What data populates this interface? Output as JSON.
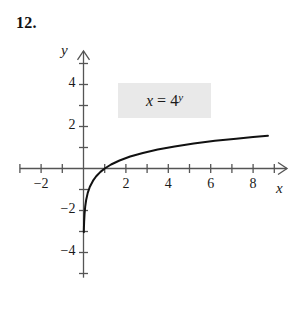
{
  "problem": {
    "number": "12."
  },
  "equation": {
    "variable": "x",
    "equals": "=",
    "base": "4",
    "exponent": "y",
    "full_text": "x = 4^y",
    "box_color": "#e9e9e9"
  },
  "axes": {
    "x_name": "x",
    "y_name": "y",
    "line_color": "#555555",
    "x_tick_labels": [
      {
        "value": -2,
        "text": "−2"
      },
      {
        "value": 2,
        "text": "2"
      },
      {
        "value": 4,
        "text": "4"
      },
      {
        "value": 6,
        "text": "6"
      },
      {
        "value": 8,
        "text": "8"
      }
    ],
    "y_tick_labels": [
      {
        "value": 4,
        "text": "4"
      },
      {
        "value": 2,
        "text": "2"
      },
      {
        "value": -2,
        "text": "−2"
      },
      {
        "value": -4,
        "text": "−4"
      }
    ]
  },
  "chart_data": {
    "type": "line",
    "title": "",
    "xlabel": "x",
    "ylabel": "y",
    "annotations": [
      "x = 4^y"
    ],
    "grid": false,
    "legend": "none",
    "xlim": [
      -3,
      9.6
    ],
    "ylim": [
      -5.2,
      5.6
    ],
    "x_ticks": [
      -3,
      -2,
      -1,
      1,
      2,
      3,
      4,
      5,
      6,
      7,
      8,
      9
    ],
    "x_ticks_labeled": [
      -2,
      2,
      4,
      6,
      8
    ],
    "y_ticks": [
      -5,
      -4,
      -3,
      -2,
      -1,
      1,
      2,
      3,
      4,
      5
    ],
    "y_ticks_labeled": [
      -4,
      -2,
      2,
      4
    ],
    "curve_color": "#111111",
    "series": [
      {
        "name": "x = 4^y",
        "equation": "y = log_4(x)",
        "x": [
          0.015,
          0.02,
          0.03,
          0.05,
          0.08,
          0.125,
          0.2,
          0.3,
          0.45,
          0.6,
          0.8,
          1.0,
          1.3,
          1.7,
          2.2,
          2.8,
          3.5,
          4.3,
          5.2,
          6.2,
          7.2,
          8.0,
          8.7
        ],
        "y": [
          -3.03,
          -2.82,
          -2.53,
          -2.16,
          -1.82,
          -1.5,
          -1.16,
          -0.87,
          -0.58,
          -0.37,
          -0.16,
          0.0,
          0.19,
          0.38,
          0.57,
          0.74,
          0.9,
          1.05,
          1.19,
          1.32,
          1.42,
          1.5,
          1.56
        ]
      }
    ]
  }
}
